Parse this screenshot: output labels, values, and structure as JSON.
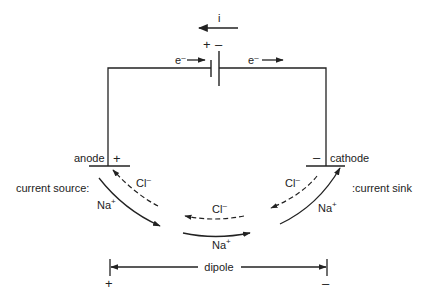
{
  "current": {
    "label": "i",
    "direction": "left"
  },
  "battery": {
    "positive": "+",
    "negative": "–"
  },
  "electron_left": {
    "label": "e",
    "charge": "–",
    "direction": "right"
  },
  "electron_right": {
    "label": "e",
    "charge": "–",
    "direction": "right"
  },
  "anode": {
    "label": "anode",
    "sign": "+"
  },
  "cathode": {
    "label": "cathode",
    "sign": "–"
  },
  "current_source": {
    "label": "current source:"
  },
  "current_sink": {
    "label": ":current sink"
  },
  "ions": {
    "left_cl": {
      "label": "Cl",
      "charge": "–",
      "flow": "toward anode",
      "style": "dashed"
    },
    "left_na": {
      "label": "Na",
      "charge": "+",
      "flow": "away from anode",
      "style": "solid"
    },
    "mid_cl": {
      "label": "Cl",
      "charge": "–",
      "flow": "left",
      "style": "dashed"
    },
    "mid_na": {
      "label": "Na",
      "charge": "+",
      "flow": "right",
      "style": "solid"
    },
    "right_cl": {
      "label": "Cl",
      "charge": "–",
      "flow": "away from cathode",
      "style": "dashed"
    },
    "right_na": {
      "label": "Na",
      "charge": "+",
      "flow": "toward cathode",
      "style": "solid"
    }
  },
  "dipole": {
    "label": "dipole",
    "left_sign": "+",
    "right_sign": "–"
  },
  "colors": {
    "ink": "#222222",
    "background": "#ffffff"
  }
}
